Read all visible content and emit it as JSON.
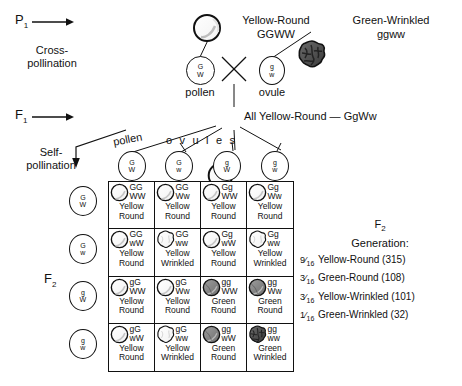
{
  "diagram": {
    "stage_labels": {
      "p1": "P",
      "p1_sub": "1",
      "f1": "F",
      "f1_sub": "1",
      "f2": "F",
      "f2_sub": "2",
      "cross_pollination_line1": "Cross-",
      "cross_pollination_line2": "pollination",
      "self_pollination_line1": "Self-",
      "self_pollination_line2": "pollination"
    },
    "parents": [
      {
        "name": "parent-yellow-round",
        "phenotype": "Yellow-Round",
        "genotype": "GGWW",
        "seed_type": "round-yellow"
      },
      {
        "name": "parent-green-wrinkled",
        "phenotype": "Green-Wrinkled",
        "genotype": "ggww",
        "seed_type": "wrinkled-green"
      }
    ],
    "p1_gametes": [
      {
        "label": "pollen",
        "allele1": "G",
        "allele2": "W"
      },
      {
        "label": "ovule",
        "allele1": "g",
        "allele2": "w"
      }
    ],
    "cross_symbol": "×",
    "f1_text": "All  Yellow-Round — GgWw",
    "f1_seed_type": "round-yellow",
    "gamete_headers": {
      "pollen_label": "pollen",
      "ovules_label": "o v u l e s"
    },
    "top_gametes": [
      {
        "allele1": "G",
        "allele2": "W"
      },
      {
        "allele1": "G",
        "allele2": "w"
      },
      {
        "allele1": "g",
        "allele2": "W"
      },
      {
        "allele1": "g",
        "allele2": "w"
      }
    ],
    "side_gametes": [
      {
        "allele1": "G",
        "allele2": "W"
      },
      {
        "allele1": "G",
        "allele2": "w"
      },
      {
        "allele1": "g",
        "allele2": "W"
      },
      {
        "allele1": "g",
        "allele2": "w"
      }
    ],
    "punnett_cells": [
      {
        "geno1": "GG",
        "geno2": "WW",
        "pheno1": "Yellow",
        "pheno2": "Round",
        "seed_type": "round-yellow"
      },
      {
        "geno1": "GG",
        "geno2": "Ww",
        "pheno1": "Yellow",
        "pheno2": "Round",
        "seed_type": "round-yellow"
      },
      {
        "geno1": "Gg",
        "geno2": "WW",
        "pheno1": "Yellow",
        "pheno2": "Round",
        "seed_type": "round-yellow"
      },
      {
        "geno1": "Gg",
        "geno2": "Ww",
        "pheno1": "Yellow",
        "pheno2": "Round",
        "seed_type": "round-yellow"
      },
      {
        "geno1": "GG",
        "geno2": "wW",
        "pheno1": "Yellow",
        "pheno2": "Round",
        "seed_type": "round-yellow"
      },
      {
        "geno1": "GG",
        "geno2": "ww",
        "pheno1": "Yellow",
        "pheno2": "Wrinkled",
        "seed_type": "wrinkled-yellow"
      },
      {
        "geno1": "Gg",
        "geno2": "wW",
        "pheno1": "Yellow",
        "pheno2": "Round",
        "seed_type": "round-yellow"
      },
      {
        "geno1": "Gg",
        "geno2": "ww",
        "pheno1": "Yellow",
        "pheno2": "Wrinkled",
        "seed_type": "wrinkled-yellow"
      },
      {
        "geno1": "gG",
        "geno2": "WW",
        "pheno1": "Yellow",
        "pheno2": "Round",
        "seed_type": "round-yellow"
      },
      {
        "geno1": "gG",
        "geno2": "Ww",
        "pheno1": "Yellow",
        "pheno2": "Round",
        "seed_type": "round-yellow"
      },
      {
        "geno1": "gg",
        "geno2": "WW",
        "pheno1": "Green",
        "pheno2": "Round",
        "seed_type": "round-green"
      },
      {
        "geno1": "gg",
        "geno2": "Ww",
        "pheno1": "Green",
        "pheno2": "Round",
        "seed_type": "round-green"
      },
      {
        "geno1": "gG",
        "geno2": "wW",
        "pheno1": "Yellow",
        "pheno2": "Round",
        "seed_type": "round-yellow"
      },
      {
        "geno1": "gG",
        "geno2": "ww",
        "pheno1": "Yellow",
        "pheno2": "Wrinkled",
        "seed_type": "wrinkled-yellow"
      },
      {
        "geno1": "gg",
        "geno2": "wW",
        "pheno1": "Green",
        "pheno2": "Round",
        "seed_type": "round-green"
      },
      {
        "geno1": "gg",
        "geno2": "ww",
        "pheno1": "Green",
        "pheno2": "Wrinkled",
        "seed_type": "wrinkled-green"
      }
    ],
    "legend": {
      "heading_main": "F",
      "heading_sub": "2",
      "heading_line2": "Generation:",
      "rows": [
        {
          "num": "9",
          "den": "16",
          "text": "Yellow-Round (315)"
        },
        {
          "num": "3",
          "den": "16",
          "text": "Green-Round (108)"
        },
        {
          "num": "3",
          "den": "16",
          "text": "Yellow-Wrinkled (101)"
        },
        {
          "num": "1",
          "den": "16",
          "text": "Green-Wrinkled (32)"
        }
      ]
    },
    "colors": {
      "ink": "#111111",
      "paper": "#ffffff",
      "seed_yellow": "#ffffff",
      "seed_green": "#8c8c8c",
      "seed_green_dark": "#4a4a4a"
    }
  }
}
